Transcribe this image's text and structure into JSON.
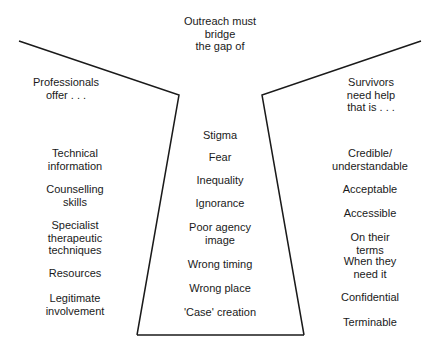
{
  "header": {
    "center": "Outreach must\nbridge\nthe gap of",
    "left": "Professionals\noffer . . .",
    "right": "Survivors need help\nthat is . . ."
  },
  "professionals_offer": [
    "Technical\ninformation",
    "Counselling\nskills",
    "Specialist\ntherapeutic\ntechniques",
    "Resources",
    "Legitimate\ninvolvement"
  ],
  "gap_barriers": [
    "Stigma",
    "Fear",
    "Inequality",
    "Ignorance",
    "Poor agency\nimage",
    "Wrong timing",
    "Wrong place",
    "'Case' creation"
  ],
  "survivors_need": [
    "Credible/\nunderstandable",
    "Acceptable",
    "Accessible",
    "On their terms",
    "When they\nneed it",
    "Confidential",
    "Terminable"
  ],
  "colors": {
    "line": "#1a1a1a",
    "text": "#1a1a1a",
    "background": "#ffffff"
  }
}
